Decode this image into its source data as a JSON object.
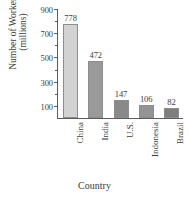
{
  "chart_data": {
    "type": "bar",
    "title": "",
    "xlabel": "Country",
    "ylabel_line1": "Number of Workers",
    "ylabel_line2": "(millions)",
    "categories": [
      "China",
      "India",
      "U.S.",
      "Indonesia",
      "Brazil"
    ],
    "values": [
      778,
      472,
      147,
      106,
      82
    ],
    "value_labels": [
      "778",
      "472",
      "147",
      "106",
      "82"
    ],
    "ylim": [
      0,
      900
    ],
    "ytick_labels": [
      "900",
      "700",
      "500",
      "300",
      "100"
    ],
    "ytick_values": [
      900,
      700,
      500,
      300,
      100
    ],
    "yminor_values": [
      800,
      600,
      400,
      200
    ],
    "grid": false,
    "legend": "none",
    "bar_colors": [
      "#d2d2d2",
      "#9a9a9a",
      "#898989",
      "#949494",
      "#7e7e7e"
    ],
    "bar_border_color": "#8d8d8d",
    "axis_color": "#5d5d5d"
  }
}
